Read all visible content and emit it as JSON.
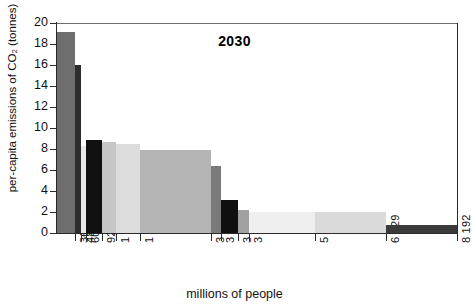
{
  "chart_data": {
    "type": "bar",
    "title": "2030",
    "xlabel": "millions of people",
    "ylabel": "per-capita emissions of CO₂ (tonnes)",
    "ylim": [
      0,
      20
    ],
    "yticks": [
      0,
      2,
      4,
      6,
      8,
      10,
      12,
      14,
      16,
      18,
      20
    ],
    "ytick_labels": [
      "0",
      "2",
      "4",
      "6",
      "8",
      "10",
      "12",
      "14",
      "16",
      "18",
      "20"
    ],
    "xlim": [
      0,
      8192
    ],
    "xtick_labels": [
      "362",
      "485",
      "603",
      "921",
      "1 205",
      "1 702",
      "3 160",
      "3 357",
      "3 701",
      "3 937",
      "5 276",
      "6 729",
      "8 192"
    ],
    "xticks": [
      362,
      485,
      603,
      921,
      1205,
      1702,
      3160,
      3357,
      3701,
      3937,
      5276,
      6729,
      8192
    ],
    "grid": false,
    "legend": null,
    "note": "Variable-width (population-weighted) bar chart: bar width = size of population group in millions, bar height = per-capita CO2 emissions in tonnes.",
    "bars": [
      {
        "x_start": 0,
        "x_end": 362,
        "width": 362,
        "value": 19.1,
        "color": "#6e6e6e"
      },
      {
        "x_start": 362,
        "x_end": 485,
        "width": 123,
        "value": 16.0,
        "color": "#2d2d2d"
      },
      {
        "x_start": 485,
        "x_end": 603,
        "width": 118,
        "value": 8.3,
        "color": "#e8e8e8"
      },
      {
        "x_start": 603,
        "x_end": 921,
        "width": 318,
        "value": 8.9,
        "color": "#111111"
      },
      {
        "x_start": 921,
        "x_end": 1205,
        "width": 284,
        "value": 8.7,
        "color": "#c6c6c6"
      },
      {
        "x_start": 1205,
        "x_end": 1702,
        "width": 497,
        "value": 8.5,
        "color": "#dcdcdc"
      },
      {
        "x_start": 1702,
        "x_end": 3160,
        "width": 1458,
        "value": 7.9,
        "color": "#b4b4b4"
      },
      {
        "x_start": 3160,
        "x_end": 3357,
        "width": 197,
        "value": 6.4,
        "color": "#7a7a7a"
      },
      {
        "x_start": 3357,
        "x_end": 3701,
        "width": 344,
        "value": 3.1,
        "color": "#101010"
      },
      {
        "x_start": 3701,
        "x_end": 3937,
        "width": 236,
        "value": 2.2,
        "color": "#a0a0a0"
      },
      {
        "x_start": 3937,
        "x_end": 5276,
        "width": 1339,
        "value": 2.0,
        "color": "#efefef"
      },
      {
        "x_start": 5276,
        "x_end": 6729,
        "width": 1453,
        "value": 2.0,
        "color": "#dadada"
      },
      {
        "x_start": 6729,
        "x_end": 8192,
        "width": 1463,
        "value": 0.75,
        "color": "#3a3a3a"
      }
    ]
  },
  "axis_colors": {
    "spine": "#2a2a2a",
    "top_rule": "#6e6e6e",
    "text": "#111111",
    "background": "#ffffff"
  }
}
